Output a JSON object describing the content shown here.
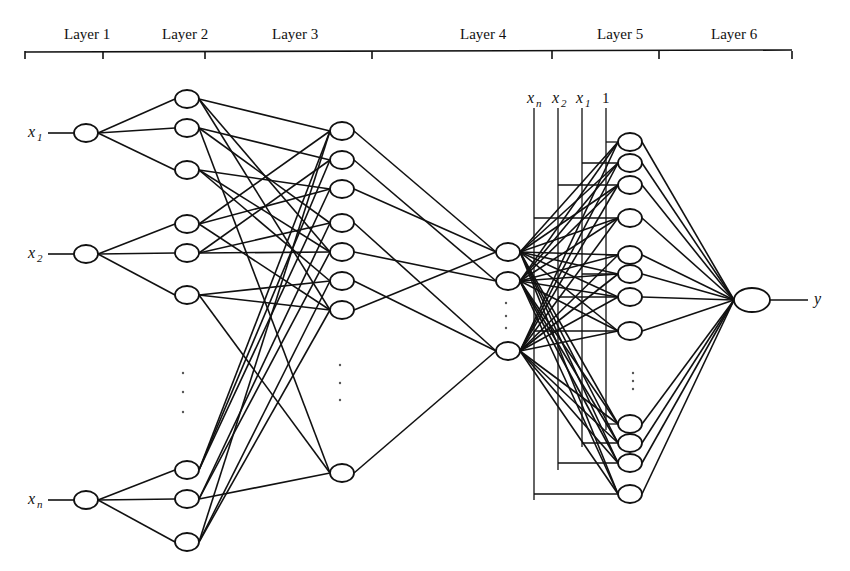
{
  "figure": {
    "layer_labels": [
      {
        "label": "Layer 1",
        "x": 64
      },
      {
        "label": "Layer 2",
        "x": 162
      },
      {
        "label": "Layer 3",
        "x": 272
      },
      {
        "label": "Layer 4",
        "x": 460
      },
      {
        "label": "Layer 5",
        "x": 597
      },
      {
        "label": "Layer 6",
        "x": 711
      }
    ],
    "layer_bracket_ticks": [
      25,
      103,
      205,
      372,
      552,
      659,
      792
    ],
    "inputs": [
      {
        "var": "x",
        "sub": "1"
      },
      {
        "var": "x",
        "sub": "2"
      },
      {
        "var": "x",
        "sub": "n"
      }
    ],
    "bus_labels": [
      {
        "var": "x",
        "sub": "n"
      },
      {
        "var": "x",
        "sub": "2"
      },
      {
        "var": "x",
        "sub": "1"
      },
      {
        "var": "1",
        "sub": ""
      }
    ],
    "output": {
      "var": "y"
    },
    "ellipsis": "⋮"
  }
}
